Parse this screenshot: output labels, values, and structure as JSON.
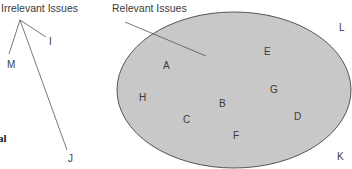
{
  "diagram": {
    "irrelevant_title": "Irrelevant Issues",
    "relevant_title": "Relevant Issues",
    "inside_labels": [
      {
        "id": "A",
        "x": 163,
        "y": 60
      },
      {
        "id": "B",
        "x": 219,
        "y": 98
      },
      {
        "id": "C",
        "x": 183,
        "y": 114
      },
      {
        "id": "D",
        "x": 294,
        "y": 111
      },
      {
        "id": "E",
        "x": 264,
        "y": 46
      },
      {
        "id": "F",
        "x": 233,
        "y": 130
      },
      {
        "id": "G",
        "x": 270,
        "y": 84
      },
      {
        "id": "H",
        "x": 139,
        "y": 92
      }
    ],
    "outside_labels": [
      {
        "id": "I",
        "x": 49,
        "y": 36
      },
      {
        "id": "J",
        "x": 68,
        "y": 153
      },
      {
        "id": "K",
        "x": 337,
        "y": 151
      },
      {
        "id": "L",
        "x": 339,
        "y": 22
      },
      {
        "id": "M",
        "x": 7,
        "y": 59
      }
    ],
    "left_fragment": "al",
    "colors": {
      "ellipse_fill": "#c8c8c8",
      "ellipse_stroke": "#555555",
      "line": "#555555"
    }
  }
}
